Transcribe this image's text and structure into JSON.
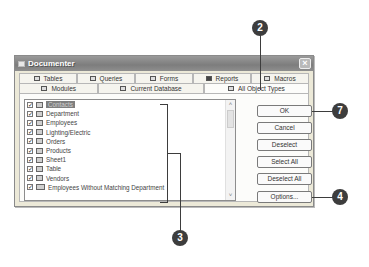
{
  "window": {
    "title": "Documenter",
    "close_label": "×"
  },
  "tabs": {
    "row1": [
      {
        "label": "Tables",
        "icon": "table-icon"
      },
      {
        "label": "Queries",
        "icon": "query-icon"
      },
      {
        "label": "Forms",
        "icon": "form-icon"
      },
      {
        "label": "Reports",
        "icon": "report-icon"
      },
      {
        "label": "Macros",
        "icon": "macro-icon"
      }
    ],
    "row2": [
      {
        "label": "Modules",
        "icon": "module-icon"
      },
      {
        "label": "Current Database",
        "icon": "database-icon"
      },
      {
        "label": "All Object Types",
        "icon": "all-objects-icon",
        "active": true
      }
    ]
  },
  "list": {
    "items": [
      {
        "label": "Contacts",
        "checked": true,
        "selected": true
      },
      {
        "label": "Department",
        "checked": true
      },
      {
        "label": "Employees",
        "checked": true
      },
      {
        "label": "Lighting/Electric",
        "checked": true
      },
      {
        "label": "Orders",
        "checked": true
      },
      {
        "label": "Products",
        "checked": true
      },
      {
        "label": "Sheet1",
        "checked": true
      },
      {
        "label": "Table",
        "checked": true
      },
      {
        "label": "Vendors",
        "checked": true
      },
      {
        "label": "Employees Without Matching Department",
        "checked": true,
        "type": "query"
      }
    ],
    "check_glyph": "✓",
    "scroll_up": "˄",
    "scroll_down": "˅"
  },
  "buttons": {
    "ok": "OK",
    "cancel": "Cancel",
    "deselect": "Deselect",
    "select_all": "Select All",
    "deselect_all": "Deselect All",
    "options": "Options..."
  },
  "callouts": {
    "c2": "2",
    "c3": "3",
    "c4": "4",
    "c7": "7"
  },
  "colors": {
    "callout": "#3d3d3d",
    "titlebar": "#8a8a8a",
    "selection": "#7f7f7f"
  }
}
